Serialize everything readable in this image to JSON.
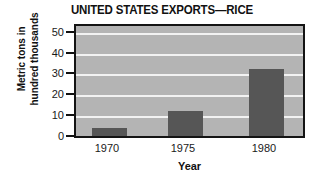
{
  "chart_data": {
    "type": "bar",
    "title": "UNITED STATES EXPORTS—RICE",
    "xlabel": "Year",
    "ylabel_lines": [
      "Metric tons in",
      "hundred thousands"
    ],
    "ylabel": "Metric tons in hundred thousands",
    "categories": [
      "1970",
      "1975",
      "1980"
    ],
    "values": [
      4.5,
      13,
      33
    ],
    "ylim": [
      0,
      55
    ],
    "yticks": [
      0,
      10,
      20,
      30,
      40,
      50
    ],
    "ytick_labels": [
      "0",
      "10",
      "20",
      "30",
      "40",
      "50"
    ],
    "grid": true,
    "gridlines_at": [
      0,
      10,
      20,
      30,
      40,
      50
    ],
    "legend": "none",
    "colors": {
      "bar": "#565656",
      "plot_background": "#b4b4b4",
      "gridline": "#f2f2f2",
      "axis_border": "#141414",
      "text": "#111111",
      "figure_background": "#ffffff"
    }
  }
}
